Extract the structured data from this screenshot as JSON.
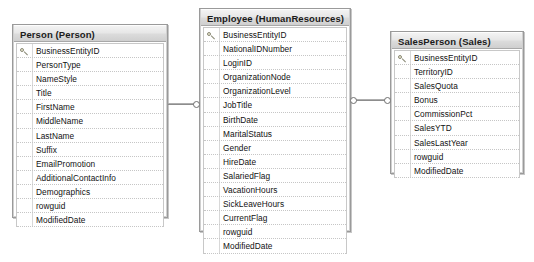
{
  "diagram": {
    "tables": [
      {
        "id": "person",
        "name": "Person (Person)",
        "columns": [
          {
            "name": "BusinessEntityID",
            "key": true
          },
          {
            "name": "PersonType",
            "key": false
          },
          {
            "name": "NameStyle",
            "key": false
          },
          {
            "name": "Title",
            "key": false
          },
          {
            "name": "FirstName",
            "key": false
          },
          {
            "name": "MiddleName",
            "key": false
          },
          {
            "name": "LastName",
            "key": false
          },
          {
            "name": "Suffix",
            "key": false
          },
          {
            "name": "EmailPromotion",
            "key": false
          },
          {
            "name": "AdditionalContactInfo",
            "key": false
          },
          {
            "name": "Demographics",
            "key": false
          },
          {
            "name": "rowguid",
            "key": false
          },
          {
            "name": "ModifiedDate",
            "key": false
          }
        ]
      },
      {
        "id": "employee",
        "name": "Employee (HumanResources)",
        "columns": [
          {
            "name": "BusinessEntityID",
            "key": true
          },
          {
            "name": "NationalIDNumber",
            "key": false
          },
          {
            "name": "LoginID",
            "key": false
          },
          {
            "name": "OrganizationNode",
            "key": false
          },
          {
            "name": "OrganizationLevel",
            "key": false
          },
          {
            "name": "JobTitle",
            "key": false
          },
          {
            "name": "BirthDate",
            "key": false
          },
          {
            "name": "MaritalStatus",
            "key": false
          },
          {
            "name": "Gender",
            "key": false
          },
          {
            "name": "HireDate",
            "key": false
          },
          {
            "name": "SalariedFlag",
            "key": false
          },
          {
            "name": "VacationHours",
            "key": false
          },
          {
            "name": "SickLeaveHours",
            "key": false
          },
          {
            "name": "CurrentFlag",
            "key": false
          },
          {
            "name": "rowguid",
            "key": false
          },
          {
            "name": "ModifiedDate",
            "key": false
          }
        ]
      },
      {
        "id": "salesperson",
        "name": "SalesPerson (Sales)",
        "columns": [
          {
            "name": "BusinessEntityID",
            "key": true
          },
          {
            "name": "TerritoryID",
            "key": false
          },
          {
            "name": "SalesQuota",
            "key": false
          },
          {
            "name": "Bonus",
            "key": false
          },
          {
            "name": "CommissionPct",
            "key": false
          },
          {
            "name": "SalesYTD",
            "key": false
          },
          {
            "name": "SalesLastYear",
            "key": false
          },
          {
            "name": "rowguid",
            "key": false
          },
          {
            "name": "ModifiedDate",
            "key": false
          }
        ]
      }
    ],
    "relationships": [
      {
        "id": "rel-person-employee",
        "from": "person",
        "to": "employee",
        "type": "one-to-one"
      },
      {
        "id": "rel-employee-salesperson",
        "from": "employee",
        "to": "salesperson",
        "type": "one-to-one"
      }
    ]
  }
}
